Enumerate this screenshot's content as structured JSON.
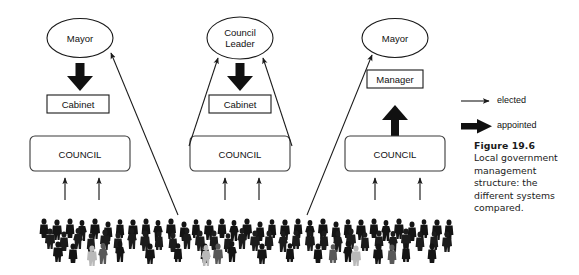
{
  "figure": {
    "caption_title": "Figure 19.6",
    "caption_body": "Local government management structure: the different systems compared."
  },
  "legend": {
    "items": [
      {
        "label": "elected",
        "arrow": "thin-arrow-icon",
        "meaning": "thin line arrow"
      },
      {
        "label": "appointed",
        "arrow": "thick-arrow-icon",
        "meaning": "bold solid arrow"
      }
    ]
  },
  "columns": [
    {
      "id": "mayor-cabinet",
      "top_node": {
        "label": "Mayor",
        "shape": "ellipse"
      },
      "mid_node": {
        "label": "Cabinet",
        "shape": "rect"
      },
      "base_node": {
        "label": "COUNCIL",
        "shape": "rounded-rect"
      },
      "appointed_arrow": "mayor-appoints-cabinet",
      "elected_arrows": 2
    },
    {
      "id": "council-leader-cabinet",
      "top_node": {
        "label": "Council Leader",
        "line1": "Council",
        "line2": "Leader",
        "shape": "ellipse"
      },
      "mid_node": {
        "label": "Cabinet",
        "shape": "rect"
      },
      "base_node": {
        "label": "COUNCIL",
        "shape": "rounded-rect"
      },
      "appointed_arrow": "leader-appoints-cabinet",
      "elected_arrows": 2
    },
    {
      "id": "mayor-manager",
      "top_node": {
        "label": "Mayor",
        "shape": "ellipse"
      },
      "mid_node": {
        "label": "Manager",
        "shape": "rect"
      },
      "base_node": {
        "label": "COUNCIL",
        "shape": "rounded-rect"
      },
      "appointed_arrow": "council-appoints-manager",
      "elected_arrows": 2
    }
  ],
  "electorate": {
    "name": "crowd-of-people",
    "description": "silhouetted crowd representing the electorate"
  },
  "colors": {
    "stroke": "#1a1a1a",
    "crowd_dark": "#141414",
    "crowd_mid": "#585858",
    "crowd_light": "#b9b9b9",
    "background": "#ffffff"
  }
}
